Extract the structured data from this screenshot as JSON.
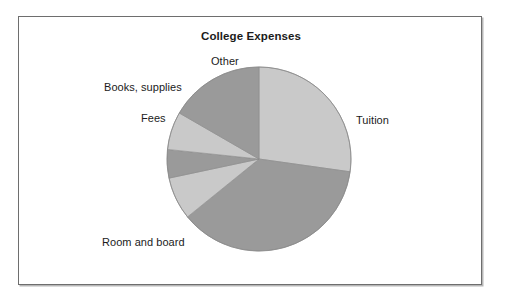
{
  "figure": {
    "title": "College Expenses",
    "background_color": "#ffffff",
    "frame_border_color": "#6e6e6e",
    "frame_shadow_color": "#b7b7b7",
    "label_text_color": "#1b1b1b"
  },
  "labels": {
    "tuition": "Tuition",
    "room_and_board": "Room and board",
    "fees": "Fees",
    "books_supplies": "Books, supplies",
    "other": "Other"
  },
  "chart_data": {
    "type": "pie",
    "title": "College Expenses",
    "xlabel": "",
    "ylabel": "",
    "legend_position": "none",
    "labels_position": "outside-callout-free",
    "start_angle_deg": 90,
    "direction": "clockwise",
    "categories": [
      "Tuition",
      "Room and board",
      "Fees",
      "Books, supplies",
      "Other"
    ],
    "values": [
      27,
      37,
      5,
      7,
      8
    ],
    "units": "percent",
    "slices": [
      {
        "label": "Tuition",
        "value": 27,
        "angle_deg": 98,
        "start_deg": 0,
        "end_deg": 98,
        "color": "#c9c9c9"
      },
      {
        "label": "Room and board",
        "value": 37,
        "angle_deg": 133,
        "start_deg": 98,
        "end_deg": 231,
        "color": "#9a9a9a"
      },
      {
        "label": "Fees",
        "value": 5,
        "angle_deg": 27,
        "start_deg": 231,
        "end_deg": 258,
        "color": "#c9c9c9"
      },
      {
        "label": "Books, supplies",
        "value": 7,
        "angle_deg": 18,
        "start_deg": 258,
        "end_deg": 276,
        "color": "#9a9a9a"
      },
      {
        "label": "Other",
        "value": 8,
        "angle_deg": 24,
        "start_deg": 276,
        "end_deg": 300,
        "color": "#c9c9c9"
      },
      {
        "label": "Other",
        "value": 8,
        "angle_deg": 60,
        "start_deg": 300,
        "end_deg": 360,
        "color": "#9a9a9a"
      }
    ],
    "geometry": {
      "center_x": 240,
      "center_y": 142,
      "radius": 92
    },
    "colors": {
      "light_gray": "#c9c9c9",
      "medium_gray": "#9a9a9a",
      "edge": "#8a8a8a"
    }
  }
}
